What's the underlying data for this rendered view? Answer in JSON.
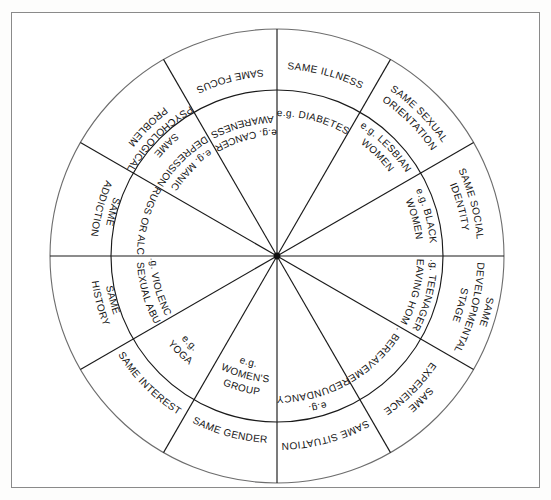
{
  "figure": {
    "type": "wheel-diagram",
    "shape": "circle",
    "rings": 2,
    "sector_count": 12,
    "sector_degrees": 30,
    "colors": {
      "stroke": "#1a1a1a",
      "outer_ring_stroke": "#6d6d6d",
      "frame": "#8a8a8a",
      "background": "#ffffff",
      "text": "#141414"
    }
  },
  "sectors": [
    {
      "index": 0,
      "start_deg": -90,
      "end_deg": -60,
      "outer_label": "SAME ILLNESS",
      "outer_lines": [
        "SAME ILLNESS"
      ],
      "inner_label": "e.g. DIABETES",
      "inner_lines": [
        "e.g. DIABETES"
      ]
    },
    {
      "index": 1,
      "start_deg": -60,
      "end_deg": -30,
      "outer_label": "SAME SEXUAL ORIENTATION",
      "outer_lines": [
        "SAME SEXUAL",
        "ORIENTATION"
      ],
      "inner_label": "e.g. LESBIAN WOMEN",
      "inner_lines": [
        "e.g. LESBIAN",
        "WOMEN"
      ]
    },
    {
      "index": 2,
      "start_deg": -30,
      "end_deg": 0,
      "outer_label": "SAME SOCIAL IDENTITY",
      "outer_lines": [
        "SAME SOCIAL",
        "IDENTITY"
      ],
      "inner_label": "e.g. BLACK WOMEN",
      "inner_lines": [
        "e.g. BLACK",
        "WOMEN"
      ]
    },
    {
      "index": 3,
      "start_deg": 0,
      "end_deg": 30,
      "outer_label": "SAME DEVELOPMENTAL STAGE",
      "outer_lines": [
        "SAME",
        "DEVELOPMENTAL",
        "STAGE"
      ],
      "inner_label": "e.g. TEENAGERS LEAVING HOME",
      "inner_lines": [
        "e.g. TEENAGERS",
        "LEAVING HOME"
      ]
    },
    {
      "index": 4,
      "start_deg": 30,
      "end_deg": 60,
      "outer_label": "SAME EXPERIENCE",
      "outer_lines": [
        "SAME",
        "EXPERIENCE"
      ],
      "inner_label": "e.g. BEREAVEMENT",
      "inner_lines": [
        "e.g. BEREAVEMENT"
      ]
    },
    {
      "index": 5,
      "start_deg": 60,
      "end_deg": 90,
      "outer_label": "SAME SITUATION",
      "outer_lines": [
        "SAME SITUATION"
      ],
      "inner_label": "e.g. REDUNDANCY",
      "inner_lines": [
        "e.g.",
        "REDUNDANCY"
      ]
    },
    {
      "index": 6,
      "start_deg": 90,
      "end_deg": 120,
      "outer_label": "SAME GENDER",
      "outer_lines": [
        "SAME GENDER"
      ],
      "inner_label": "e.g. WOMEN'S GROUP",
      "inner_lines": [
        "e.g.",
        "WOMEN'S",
        "GROUP"
      ]
    },
    {
      "index": 7,
      "start_deg": 120,
      "end_deg": 150,
      "outer_label": "SAME INTEREST",
      "outer_lines": [
        "SAME INTEREST"
      ],
      "inner_label": "e.g. YOGA",
      "inner_lines": [
        "e.g.",
        "YOGA"
      ]
    },
    {
      "index": 8,
      "start_deg": 150,
      "end_deg": 180,
      "outer_label": "SAME HISTORY",
      "outer_lines": [
        "SAME",
        "HISTORY"
      ],
      "inner_label": "e.g. VIOLENCE OR SEXUAL ABUSE",
      "inner_lines": [
        "e.g. VIOLENCE",
        "OR SEXUAL ABUSE"
      ]
    },
    {
      "index": 9,
      "start_deg": 180,
      "end_deg": 210,
      "outer_label": "SAME ADDICTION",
      "outer_lines": [
        "SAME",
        "ADDICTION"
      ],
      "inner_label": "e.g. DRUGS OR ALCOHOL",
      "inner_lines": [
        "e.g. DRUGS OR ALCOHOL"
      ]
    },
    {
      "index": 10,
      "start_deg": 210,
      "end_deg": 240,
      "outer_label": "SAME PSYCHOLOGICAL PROBLEM",
      "outer_lines": [
        "SAME",
        "PSYCHOLOGICAL",
        "PROBLEM"
      ],
      "inner_label": "e.g. MANIC DEPRESSION",
      "inner_lines": [
        "e.g. MANIC",
        "DEPRESSION"
      ]
    },
    {
      "index": 11,
      "start_deg": 240,
      "end_deg": 270,
      "outer_label": "SAME FOCUS",
      "outer_lines": [
        "SAME FOCUS"
      ],
      "inner_label": "e.g. CANCER AWARENESS",
      "inner_lines": [
        "e.g. CANCER",
        "AWARENESS"
      ]
    }
  ]
}
